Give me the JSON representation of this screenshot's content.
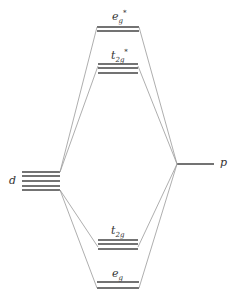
{
  "diagram": {
    "type": "molecular-orbital energy level diagram",
    "left_level": {
      "label": "d",
      "degeneracy": 5
    },
    "right_level": {
      "label": "p"
    },
    "mo_levels": [
      {
        "name": "eg_star",
        "label_main": "e",
        "label_sub": "g",
        "label_sup": "*",
        "degeneracy": 2
      },
      {
        "name": "t2g_star",
        "label_main": "t",
        "label_sub": "2g",
        "label_sup": "*",
        "degeneracy": 3
      },
      {
        "name": "t2g",
        "label_main": "t",
        "label_sub": "2g",
        "label_sup": "",
        "degeneracy": 3
      },
      {
        "name": "eg",
        "label_main": "e",
        "label_sub": "g",
        "label_sup": "",
        "degeneracy": 2
      }
    ],
    "line_color": "#555555",
    "connector_color": "#999999"
  }
}
